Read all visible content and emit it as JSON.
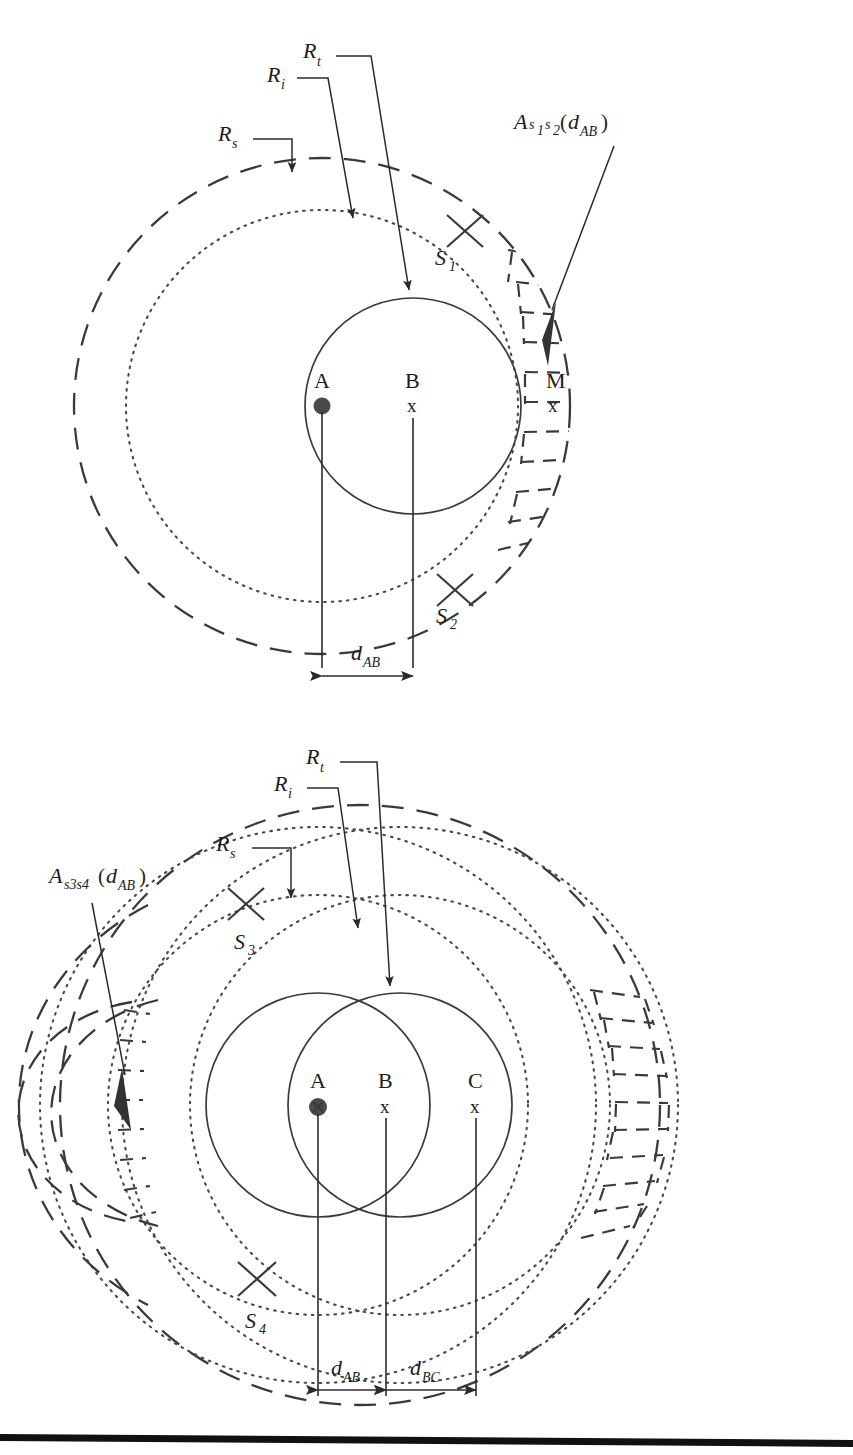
{
  "figure": {
    "type": "technical-diagram",
    "background": "#ffffff",
    "ink": "#2b2b2b",
    "panels": [
      {
        "id": "top",
        "name": "two-node-coverage-diagram",
        "radius_labels": [
          {
            "key": "Rs",
            "base": "R",
            "sub": "s",
            "meaning": "sensing-radius"
          },
          {
            "key": "Ri",
            "base": "R",
            "sub": "i",
            "meaning": "interference-radius"
          },
          {
            "key": "Rt",
            "base": "R",
            "sub": "t",
            "meaning": "transmission-radius"
          }
        ],
        "area_label": {
          "prefix": "A",
          "sub1": "s",
          "num1": "1",
          "sub2": "s",
          "num2": "2",
          "arg_open": "(",
          "arg_base": "d",
          "arg_sub": "AB",
          "arg_close": ")"
        },
        "nodes": [
          {
            "id": "A",
            "label": "A",
            "marker": "filled-dot"
          },
          {
            "id": "B",
            "label": "B",
            "marker": "x"
          },
          {
            "id": "M",
            "label": "M",
            "marker": "x"
          }
        ],
        "intersections": [
          {
            "label": "S",
            "sub": "1"
          },
          {
            "label": "S",
            "sub": "2"
          }
        ],
        "dimensions": [
          {
            "base": "d",
            "sub": "AB"
          }
        ]
      },
      {
        "id": "bottom",
        "name": "three-node-coverage-diagram",
        "radius_labels": [
          {
            "key": "Rs",
            "base": "R",
            "sub": "s",
            "meaning": "sensing-radius"
          },
          {
            "key": "Ri",
            "base": "R",
            "sub": "i",
            "meaning": "interference-radius"
          },
          {
            "key": "Rt",
            "base": "R",
            "sub": "t",
            "meaning": "transmission-radius"
          }
        ],
        "area_label": {
          "prefix": "A",
          "sub": "s3s4",
          "arg_open": "(",
          "arg_base": "d",
          "arg_sub": "AB",
          "arg_close": ")"
        },
        "nodes": [
          {
            "id": "A",
            "label": "A",
            "marker": "filled-dot-x"
          },
          {
            "id": "B",
            "label": "B",
            "marker": "x"
          },
          {
            "id": "C",
            "label": "C",
            "marker": "x"
          }
        ],
        "intersections": [
          {
            "label": "S",
            "sub": "3"
          },
          {
            "label": "S",
            "sub": "4"
          }
        ],
        "dimensions": [
          {
            "base": "d",
            "sub": "AB"
          },
          {
            "base": "d",
            "sub": "BC"
          }
        ]
      }
    ],
    "glyphs": {
      "x_marker": "x",
      "paren_open": "(",
      "paren_close": ")"
    }
  }
}
